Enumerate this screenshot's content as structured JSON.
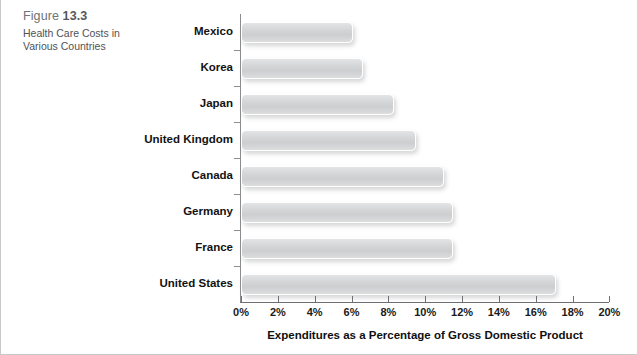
{
  "figure": {
    "number_prefix": "Figure",
    "number": "13.3",
    "caption": "Health Care Costs in Various Countries"
  },
  "chart_data": {
    "type": "bar",
    "orientation": "horizontal",
    "title": "Health Care Costs in Various Countries",
    "xlabel": "Expenditures as a Percentage of Gross Domestic Product",
    "ylabel": "",
    "xlim": [
      0,
      20
    ],
    "xticks": [
      0,
      2,
      4,
      6,
      8,
      10,
      12,
      14,
      16,
      18,
      20
    ],
    "xtick_labels": [
      "0%",
      "2%",
      "4%",
      "6%",
      "8%",
      "10%",
      "12%",
      "14%",
      "16%",
      "18%",
      "20%"
    ],
    "grid": false,
    "legend": false,
    "units": "percent of GDP",
    "categories": [
      "Mexico",
      "Korea",
      "Japan",
      "United Kingdom",
      "Canada",
      "Germany",
      "France",
      "United States"
    ],
    "values": [
      6.1,
      6.6,
      8.3,
      9.5,
      11.0,
      11.5,
      11.5,
      17.1
    ],
    "bars": [
      {
        "label": "Mexico",
        "value": 6.1
      },
      {
        "label": "Korea",
        "value": 6.6
      },
      {
        "label": "Japan",
        "value": 8.3
      },
      {
        "label": "United Kingdom",
        "value": 9.5
      },
      {
        "label": "Canada",
        "value": 11.0
      },
      {
        "label": "Germany",
        "value": 11.5
      },
      {
        "label": "France",
        "value": 11.5
      },
      {
        "label": "United States",
        "value": 17.1
      }
    ],
    "bar_color": "#d4d5d6",
    "axis_color": "#6e7073"
  }
}
